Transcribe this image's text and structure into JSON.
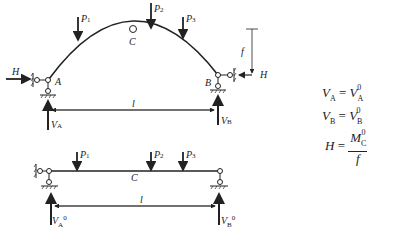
{
  "arch": {
    "loads": [
      "P1",
      "P2",
      "P3"
    ],
    "hinge_label": "C",
    "support_left": "A",
    "support_right": "B",
    "rise_label": "f",
    "span_label": "l",
    "thrust_label": "H",
    "reaction_left": "V",
    "reaction_left_sub": "A",
    "reaction_right": "V",
    "reaction_right_sub": "B"
  },
  "beam": {
    "loads": [
      "P1",
      "P2",
      "P3"
    ],
    "point_label": "C",
    "span_label": "l",
    "reaction_left": "V",
    "reaction_left_sub": "A",
    "reaction_left_sup": "0",
    "reaction_right": "V",
    "reaction_right_sub": "B",
    "reaction_right_sup": "0"
  },
  "equations": [
    {
      "lhs": "V",
      "lhs_sub": "A",
      "rhs": "V",
      "rhs_sub": "A",
      "rhs_sup": "0"
    },
    {
      "lhs": "V",
      "lhs_sub": "B",
      "rhs": "V",
      "rhs_sub": "B",
      "rhs_sup": "0"
    },
    {
      "lhs": "H",
      "num": "M",
      "num_sub": "C",
      "num_sup": "0",
      "den": "f"
    }
  ],
  "colors": {
    "line": "#222222",
    "background": "#ffffff"
  }
}
